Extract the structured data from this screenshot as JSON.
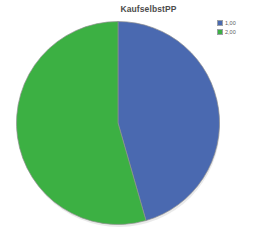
{
  "chart_data": {
    "type": "pie",
    "title": "KaufselbstPP",
    "xlabel": "",
    "ylabel": "",
    "grid": false,
    "legend_position": "top-right",
    "start_angle_deg": 0,
    "direction": "clockwise",
    "categories": [
      "1,00",
      "2,00"
    ],
    "values": [
      45.5,
      54.5
    ],
    "units": "percent",
    "slices": [
      {
        "label": "1,00",
        "value": 45.5,
        "angle_deg": 164,
        "color": "#4a69b0"
      },
      {
        "label": "2,00",
        "value": 54.5,
        "angle_deg": 196,
        "color": "#3cb043"
      }
    ],
    "annotations": []
  },
  "legend": {
    "entries": [
      {
        "label": "1,00",
        "color": "#4a69b0"
      },
      {
        "label": "2,00",
        "color": "#3cb043"
      }
    ]
  },
  "style": {
    "background": "#ffffff",
    "title_color": "#4c4c4c",
    "slice_border": "#8f8f8f",
    "shadow": "#d8d8d8"
  }
}
